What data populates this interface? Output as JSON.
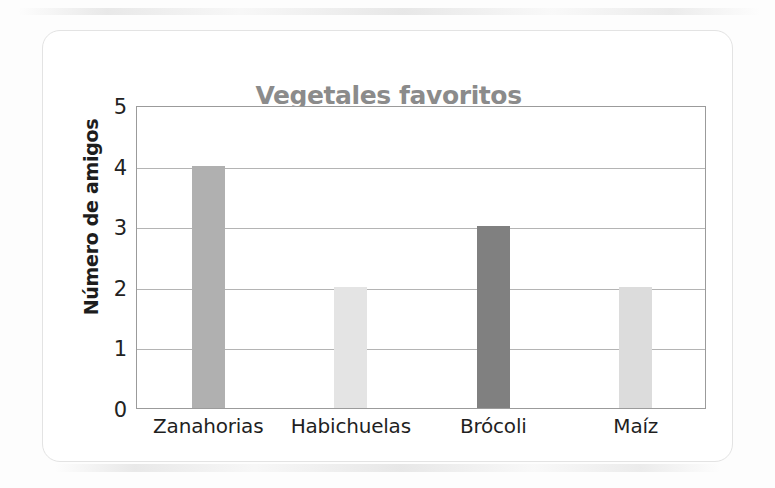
{
  "chart_data": {
    "type": "bar",
    "title": "Vegetales favoritos",
    "xlabel": "",
    "ylabel": "Número de amigos",
    "categories": [
      "Zanahorias",
      "Habichuelas",
      "Brócoli",
      "Maíz"
    ],
    "values": [
      4,
      2,
      3,
      2
    ],
    "bar_colors": [
      "#b0b0b0",
      "#e4e4e4",
      "#808080",
      "#dcdcdc"
    ],
    "ylim": [
      0,
      5
    ],
    "y_ticks": [
      0,
      1,
      2,
      3,
      4,
      5
    ],
    "y_tick_labels": [
      "0",
      "1",
      "2",
      "3",
      "4",
      "5"
    ],
    "grid": true,
    "grid_axis": "y",
    "legend": false,
    "series": [
      {
        "name": "Número de amigos",
        "values": [
          4,
          2,
          3,
          2
        ]
      }
    ]
  },
  "style": {
    "title_color": "#8b8b8b",
    "axis_label_color": "#1d1d1d",
    "tick_color": "#222222",
    "grid_color": "#b4b4b4",
    "plot_border_color": "#9b9b9b",
    "card_background": "#ffffff",
    "page_background": "#fdfdfd"
  }
}
